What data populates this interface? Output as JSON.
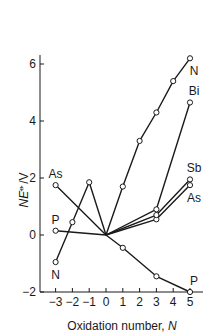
{
  "chart_data": {
    "type": "line",
    "title": "",
    "xlabel": "Oxidation number, N",
    "xlabel_main": "Oxidation number, ",
    "xlabel_var": "N",
    "ylabel": "NE⦵/V",
    "ylabel_main": "NE",
    "ylabel_sup": "⦵",
    "ylabel_unit": "/V",
    "xlim": [
      -3.4,
      5.4
    ],
    "ylim": [
      -2,
      6.5
    ],
    "x_ticks": [
      -3,
      -2,
      -1,
      0,
      1,
      2,
      3,
      4,
      5
    ],
    "x_tick_labels": [
      "−3",
      "−2",
      "−1",
      "0",
      "1",
      "2",
      "3",
      "4",
      "5"
    ],
    "y_ticks": [
      -2,
      0,
      2,
      4,
      6
    ],
    "y_tick_labels": [
      "−2",
      "0",
      "2",
      "4",
      "6"
    ],
    "grid": false,
    "legend": "inline labels",
    "series": [
      {
        "name": "N",
        "points": [
          [
            -3,
            -0.95
          ],
          [
            -2,
            0.45
          ],
          [
            -1,
            1.85
          ],
          [
            0,
            0
          ],
          [
            1,
            1.7
          ],
          [
            2,
            3.3
          ],
          [
            3,
            4.3
          ],
          [
            4,
            5.4
          ],
          [
            5,
            6.2
          ]
        ],
        "labels": [
          {
            "text": "N",
            "x": -3,
            "y": -0.95,
            "pos": "below"
          },
          {
            "text": "N",
            "x": 5,
            "y": 6.2,
            "pos": "below"
          }
        ]
      },
      {
        "name": "P",
        "points": [
          [
            -3,
            0.15
          ],
          [
            0,
            0
          ],
          [
            1,
            -0.45
          ],
          [
            3,
            -1.45
          ],
          [
            5,
            -2.0
          ]
        ],
        "labels": [
          {
            "text": "P",
            "x": -3,
            "y": 0.15,
            "pos": "above"
          },
          {
            "text": "P",
            "x": 5,
            "y": -2.0,
            "pos": "above"
          }
        ]
      },
      {
        "name": "As",
        "points": [
          [
            -3,
            1.75
          ],
          [
            0,
            0
          ],
          [
            3,
            0.55
          ],
          [
            5,
            1.75
          ]
        ],
        "labels": [
          {
            "text": "As",
            "x": -3,
            "y": 1.75,
            "pos": "above"
          },
          {
            "text": "As",
            "x": 5,
            "y": 1.75,
            "pos": "below"
          }
        ]
      },
      {
        "name": "Sb",
        "points": [
          [
            0,
            0
          ],
          [
            3,
            0.7
          ],
          [
            5,
            1.95
          ]
        ],
        "labels": [
          {
            "text": "Sb",
            "x": 5,
            "y": 1.95,
            "pos": "above"
          }
        ]
      },
      {
        "name": "Bi",
        "points": [
          [
            0,
            0
          ],
          [
            3,
            0.9
          ],
          [
            5,
            4.65
          ]
        ],
        "labels": [
          {
            "text": "Bi",
            "x": 5,
            "y": 4.65,
            "pos": "above"
          }
        ]
      }
    ]
  },
  "style": {
    "line_color": "#1a1a1a",
    "marker_fill": "#ffffff",
    "background": "#ffffff"
  }
}
